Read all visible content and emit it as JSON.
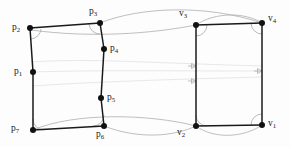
{
  "figure": {
    "background_color": "#fdfdfd",
    "edge_color": "#1a1a1a",
    "arc_color": "#a8a8a8",
    "curve_color": "#aaaaaa",
    "faint_color": "#dedede",
    "dot_color": "#111111",
    "width": 290,
    "height": 147
  },
  "left_shape": {
    "name": "source-polygon",
    "vertices": [
      {
        "id": "p2",
        "label": "p",
        "sub": "2",
        "x": 30,
        "y": 28,
        "label_x": 12,
        "label_y": 23
      },
      {
        "id": "p3",
        "label": "p",
        "sub": "3",
        "x": 100,
        "y": 23,
        "label_x": 89,
        "label_y": 7
      },
      {
        "id": "p4",
        "label": "p",
        "sub": "4",
        "x": 104,
        "y": 49,
        "label_x": 110,
        "label_y": 44
      },
      {
        "id": "p5",
        "label": "p",
        "sub": "5",
        "x": 101,
        "y": 98,
        "label_x": 107,
        "label_y": 93
      },
      {
        "id": "p6",
        "label": "p",
        "sub": "6",
        "x": 104,
        "y": 126,
        "label_x": 96,
        "label_y": 130
      },
      {
        "id": "p7",
        "label": "p",
        "sub": "7",
        "x": 33,
        "y": 130,
        "label_x": 11,
        "label_y": 124
      },
      {
        "id": "p1",
        "label": "p",
        "sub": "1",
        "x": 33,
        "y": 72,
        "label_x": 14,
        "label_y": 67
      }
    ]
  },
  "right_shape": {
    "name": "target-rectangle",
    "vertices": [
      {
        "id": "v3",
        "label": "v",
        "sub": "3",
        "x": 196,
        "y": 25,
        "label_x": 179,
        "label_y": 9
      },
      {
        "id": "v4",
        "label": "v",
        "sub": "4",
        "x": 262,
        "y": 23,
        "label_x": 268,
        "label_y": 14
      },
      {
        "id": "v1",
        "label": "v",
        "sub": "1",
        "x": 262,
        "y": 125,
        "label_x": 268,
        "label_y": 119
      },
      {
        "id": "v2",
        "label": "v",
        "sub": "2",
        "x": 196,
        "y": 126,
        "label_x": 177,
        "label_y": 128
      }
    ]
  },
  "correspondence_curves": [
    {
      "name": "curve-top-outer",
      "from": "p3",
      "to": "v4"
    },
    {
      "name": "curve-top-inner",
      "from": "p2",
      "to": "v3"
    },
    {
      "name": "curve-bottom-outer",
      "from": "p7",
      "to": "v1"
    },
    {
      "name": "curve-bottom-inner",
      "from": "p6",
      "to": "v2"
    }
  ],
  "flow_arrows": [
    {
      "name": "arrow-upper",
      "x": 196,
      "y": 66
    },
    {
      "name": "arrow-mid",
      "x": 262,
      "y": 71
    },
    {
      "name": "arrow-lower",
      "x": 196,
      "y": 81
    }
  ]
}
